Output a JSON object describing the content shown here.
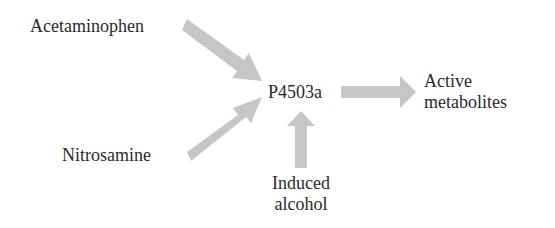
{
  "diagram": {
    "type": "pathway",
    "arrow_color": "#c6c6c6",
    "text_color": "#2a2a2a",
    "nodes": {
      "acetaminophen": "Acetaminophen",
      "nitrosamine": "Nitrosamine",
      "enzyme": "P4503a",
      "product_line1": "Active",
      "product_line2": "metabolites",
      "inducer_line1": "Induced",
      "inducer_line2": "alcohol"
    },
    "edges": [
      {
        "from": "Acetaminophen",
        "to": "P4503a"
      },
      {
        "from": "Nitrosamine",
        "to": "P4503a"
      },
      {
        "from": "Induced alcohol",
        "to": "P4503a"
      },
      {
        "from": "P4503a",
        "to": "Active metabolites"
      }
    ]
  }
}
